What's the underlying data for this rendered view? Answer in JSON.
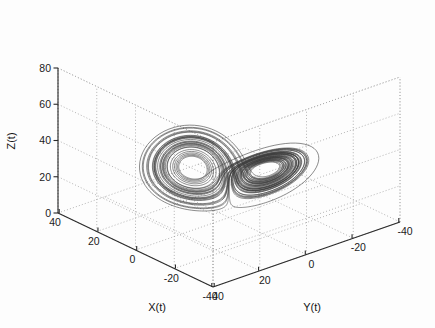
{
  "figure": {
    "background_color": "#fdfdfd",
    "line_color": "#3a3a3a",
    "axis_color": "#2a2a2a",
    "grid_color": "#9a9a9a",
    "width": 435,
    "height": 328
  },
  "chart_data": {
    "type": "line",
    "title": "",
    "projection": "3d",
    "xlabel": "X(t)",
    "ylabel": "Y(t)",
    "zlabel": "Z(t)",
    "xlim": [
      -40,
      40
    ],
    "ylim": [
      -40,
      40
    ],
    "zlim": [
      0,
      80
    ],
    "xticks": [
      40,
      20,
      0,
      -20,
      -40
    ],
    "yticks": [
      40,
      20,
      0,
      -20,
      -40
    ],
    "zticks": [
      0,
      20,
      40,
      60,
      80
    ],
    "xtick_labels": [
      "40",
      "20",
      "0",
      "-20",
      "-40"
    ],
    "ytick_labels": [
      "40",
      "20",
      "0",
      "-20",
      "-40"
    ],
    "ztick_labels": [
      "0",
      "20",
      "40",
      "60",
      "80"
    ],
    "grid": true,
    "legend": null,
    "view": {
      "azimuth": -37.5,
      "elevation": 62
    },
    "series": [
      {
        "name": "chaotic-attractor-trajectory",
        "description": "Lorenz-type chaotic attractor trajectory, two-lobed spiral",
        "system": "lorenz",
        "params": {
          "sigma": 10,
          "rho": 28,
          "beta": 2.6667
        },
        "initial_state": [
          1.0,
          1.0,
          20.0
        ],
        "dt": 0.006,
        "steps": 9000,
        "color": "#3a3a3a"
      }
    ]
  },
  "axes": {
    "x": {
      "label": "X(t)",
      "ticks": [
        "40",
        "20",
        "0",
        "-20",
        "-40"
      ]
    },
    "y": {
      "label": "Y(t)",
      "ticks": [
        "40",
        "20",
        "0",
        "-20",
        "-40"
      ]
    },
    "z": {
      "label": "Z(t)",
      "ticks": [
        "0",
        "20",
        "40",
        "60",
        "80"
      ]
    }
  }
}
